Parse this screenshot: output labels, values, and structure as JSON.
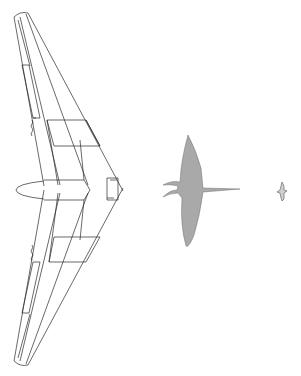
{
  "figure": {
    "colors": {
      "background": "#ffffff",
      "line": "#2a2a2a",
      "pterosaur_fill": "#a9a9a9",
      "bird_fill": "#d0d0d0"
    },
    "subjects": [
      {
        "id": "flying-wing",
        "label": ""
      },
      {
        "id": "pterosaur",
        "label": ""
      },
      {
        "id": "bird",
        "label": ""
      }
    ]
  }
}
